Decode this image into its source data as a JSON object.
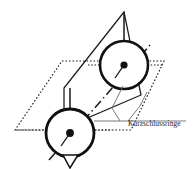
{
  "figure": {
    "title": "Kurzschlussringe",
    "background_color": "#ffffff",
    "stroke_color": "#1a1a1a",
    "thin_stroke_color": "#555555"
  },
  "annotation": {
    "label": "Kurzschlussringe",
    "label_x": 128,
    "label_y": 126,
    "leader_horizontal": "M 94 121 L 186 121",
    "leader_line_1": "M 128 121 L 140 106 L 147 92",
    "leader_line_2": "M 120 121 L 112 108 L 123 86"
  },
  "planes": {
    "horizontal_plane": {
      "name": "horizontal-reference-plane",
      "style": "dotted",
      "points": "62,61 164,61 131,130 15,130"
    },
    "inclined_plane": {
      "name": "inclined-rotor-plane",
      "style": "solid",
      "points": "124,12 64,88 64,128 141,95"
    }
  },
  "rings": [
    {
      "name": "upper-short-circuit-ring",
      "cx": 124,
      "cy": 65,
      "r": 24,
      "dot_r": 3.6,
      "stub": "M 124 12 L 124 41",
      "tail": "M 124 65 L 115 78"
    },
    {
      "name": "lower-short-circuit-ring",
      "cx": 70,
      "cy": 133,
      "r": 24,
      "dot_r": 3.9,
      "stub": "M 70 88 L 70 109",
      "tail": "M 70 133 L 61 146"
    }
  ],
  "axis": {
    "name": "rotor-axis",
    "style": "dash-dot",
    "path": "M 49 160 L 150 45"
  },
  "center_guides": [
    {
      "name": "upper-ring-center-guide",
      "path": "M 88 65 L 162 65"
    },
    {
      "name": "lower-ring-center-guide",
      "path": "M 16 130 L 112 130"
    }
  ],
  "arrow_marks": [
    {
      "name": "lower-ring-flow-arrow",
      "path": "M 63 155 L 78 155 L 70 168 Z"
    }
  ]
}
